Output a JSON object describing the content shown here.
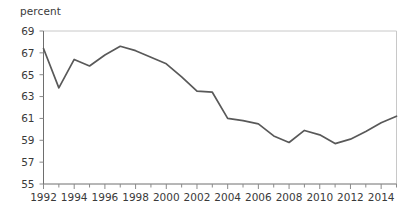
{
  "axis_unit_label": "percent",
  "style": {
    "line_color": "#595959",
    "axis_color": "#6e6e6e",
    "frame_color": "#c8c8c8",
    "tick_color": "#8a8a8a",
    "text_color": "#3a3a3a",
    "background": "#ffffff"
  },
  "chart_data": {
    "type": "line",
    "title": "",
    "subtitle": "",
    "xlabel": "",
    "ylabel": "percent",
    "ylim": [
      55,
      69
    ],
    "xlim": [
      1992,
      2015
    ],
    "grid": false,
    "legend": null,
    "y_ticks": [
      55,
      57,
      59,
      61,
      63,
      65,
      67,
      69
    ],
    "y_tick_labels": [
      "55",
      "57",
      "59",
      "61",
      "63",
      "65",
      "67",
      "69"
    ],
    "x_ticks": [
      1992,
      1993,
      1994,
      1995,
      1996,
      1997,
      1998,
      1999,
      2000,
      2001,
      2002,
      2003,
      2004,
      2005,
      2006,
      2007,
      2008,
      2009,
      2010,
      2011,
      2012,
      2013,
      2014,
      2015
    ],
    "x_tick_labels_shown": [
      "1992",
      "1994",
      "1996",
      "1998",
      "2000",
      "2002",
      "2004",
      "2006",
      "2008",
      "2010",
      "2012",
      "2014"
    ],
    "series": [
      {
        "name": "percent",
        "x": [
          1992,
          1993,
          1994,
          1995,
          1996,
          1997,
          1998,
          1999,
          2000,
          2001,
          2002,
          2003,
          2004,
          2005,
          2006,
          2007,
          2008,
          2009,
          2010,
          2011,
          2012,
          2013,
          2014,
          2015
        ],
        "values": [
          67.4,
          63.8,
          66.4,
          65.8,
          66.8,
          67.6,
          67.2,
          66.6,
          66.0,
          64.8,
          63.5,
          63.4,
          61.0,
          60.8,
          60.5,
          59.4,
          58.8,
          59.9,
          59.5,
          58.7,
          59.1,
          59.8,
          60.6,
          61.2
        ]
      }
    ],
    "annotations": []
  }
}
